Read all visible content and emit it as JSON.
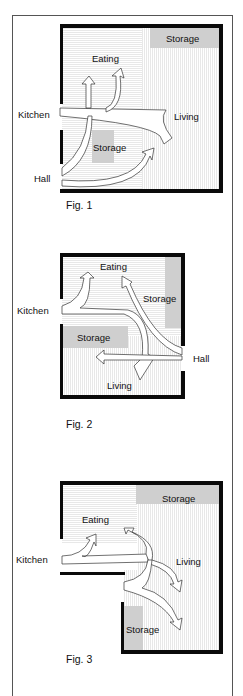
{
  "colors": {
    "wall": "#0a0a0a",
    "storage": "#cfcfcf",
    "floor_lines": "#d8d8d8",
    "frame": "#555555",
    "text": "#111111"
  },
  "figures": [
    {
      "caption": "Fig. 1",
      "labels": {
        "kitchen": "Kitchen",
        "hall": "Hall",
        "eating": "Eating",
        "living": "Living",
        "storage_top": "Storage",
        "storage_center": "Storage"
      }
    },
    {
      "caption": "Fig. 2",
      "labels": {
        "kitchen": "Kitchen",
        "hall": "Hall",
        "eating": "Eating",
        "living": "Living",
        "storage_right": "Storage",
        "storage_left": "Storage"
      }
    },
    {
      "caption": "Fig. 3",
      "labels": {
        "kitchen": "Kitchen",
        "eating": "Eating",
        "living": "Living",
        "storage_top": "Storage",
        "storage_bottom": "Storage"
      }
    }
  ]
}
